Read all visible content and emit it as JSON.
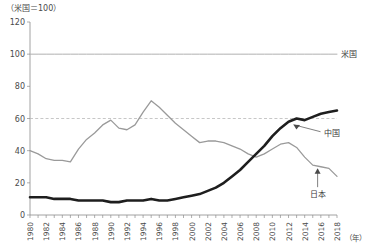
{
  "chart_data": {
    "type": "line",
    "title": "",
    "subtitle": "",
    "unit_note": "（米国＝100）",
    "xlabel": "（年）",
    "ylabel": "",
    "xlim": [
      1980,
      2018
    ],
    "ylim": [
      0,
      120
    ],
    "ytick_step": 20,
    "yticks": [
      "0",
      "20",
      "40",
      "60",
      "80",
      "100",
      "120"
    ],
    "xticks_labeled": [
      "1980",
      "1982",
      "1984",
      "1986",
      "1988",
      "1990",
      "1992",
      "1994",
      "1996",
      "1998",
      "2000",
      "2002",
      "2004",
      "2006",
      "2008",
      "2010",
      "2012",
      "2014",
      "2016",
      "2018"
    ],
    "xtick_step_minor": 1,
    "xtick_step_major": 2,
    "grid": false,
    "legend_position": "inline-annotation",
    "reference_lines": [
      {
        "name": "reference-60",
        "value": 60,
        "style": "dashed",
        "color": "#b9b9b9"
      }
    ],
    "x": [
      1980,
      1981,
      1982,
      1983,
      1984,
      1985,
      1986,
      1987,
      1988,
      1989,
      1990,
      1991,
      1992,
      1993,
      1994,
      1995,
      1996,
      1997,
      1998,
      1999,
      2000,
      2001,
      2002,
      2003,
      2004,
      2005,
      2006,
      2007,
      2008,
      2009,
      2010,
      2011,
      2012,
      2013,
      2014,
      2015,
      2016,
      2017,
      2018
    ],
    "series": [
      {
        "name": "米国",
        "label": "米国",
        "color": "#b0b0b0",
        "width": 1.0,
        "values": [
          100,
          100,
          100,
          100,
          100,
          100,
          100,
          100,
          100,
          100,
          100,
          100,
          100,
          100,
          100,
          100,
          100,
          100,
          100,
          100,
          100,
          100,
          100,
          100,
          100,
          100,
          100,
          100,
          100,
          100,
          100,
          100,
          100,
          100,
          100,
          100,
          100,
          100,
          100
        ]
      },
      {
        "name": "日本",
        "label": "日本",
        "color": "#9a9a9a",
        "width": 1.3,
        "values": [
          40,
          38,
          35,
          34,
          34,
          33,
          41,
          47,
          51,
          56,
          59,
          54,
          53,
          56,
          64,
          71,
          67,
          62,
          57,
          53,
          49,
          45,
          46,
          46,
          45,
          43,
          41,
          38,
          36,
          38,
          41,
          44,
          45,
          42,
          36,
          31,
          30,
          29,
          24
        ]
      },
      {
        "name": "中国",
        "label": "中国",
        "color": "#1e1e1e",
        "width": 2.6,
        "values": [
          11,
          11,
          11,
          10,
          10,
          10,
          9,
          9,
          9,
          9,
          8,
          8,
          9,
          9,
          9,
          10,
          9,
          9,
          10,
          11,
          12,
          13,
          15,
          17,
          20,
          24,
          28,
          33,
          38,
          43,
          49,
          54,
          58,
          60,
          59,
          61,
          63,
          64,
          65
        ]
      }
    ],
    "annotations": [
      {
        "name": "china-annotation",
        "text": "中国",
        "target_year": 2012,
        "target_value": 58
      },
      {
        "name": "japan-annotation",
        "text": "日本",
        "target_year": 2016,
        "target_value": 30
      },
      {
        "name": "us-annotation",
        "text": "米国",
        "target_year": 2018,
        "target_value": 100
      }
    ]
  }
}
